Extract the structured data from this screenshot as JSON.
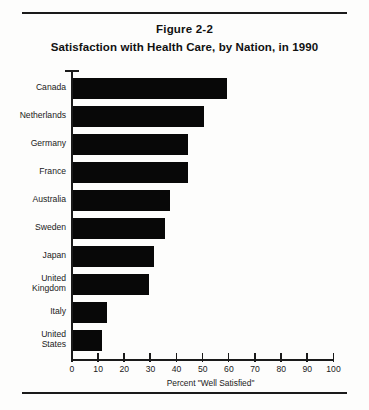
{
  "figure": {
    "number": "Figure 2-2",
    "title": "Satisfaction with Health Care, by Nation, in 1990"
  },
  "chart_data": {
    "type": "bar",
    "orientation": "horizontal",
    "title": "Satisfaction with Health Care, by Nation, in 1990",
    "subtitle": "Figure 2-2",
    "categories": [
      "Canada",
      "Netherlands",
      "Germany",
      "France",
      "Australia",
      "Sweden",
      "Japan",
      "United\nKingdom",
      "Italy",
      "United\nStates"
    ],
    "values": [
      59,
      50,
      44,
      44,
      37,
      35,
      31,
      29,
      13,
      11
    ],
    "xlabel": "Percent \"Well Satisfied\"",
    "ylabel": "",
    "xlim": [
      0,
      100
    ],
    "xticks": [
      0,
      10,
      20,
      30,
      40,
      50,
      60,
      70,
      80,
      90,
      100
    ],
    "xtick_labels": [
      "0",
      "10",
      "20",
      "30",
      "40",
      "50",
      "60",
      "70",
      "80",
      "90",
      "100"
    ],
    "grid": false,
    "legend": false,
    "bar_color": "#080808",
    "axis_color": "#1a1a1a",
    "background": "#fdfdfc"
  }
}
